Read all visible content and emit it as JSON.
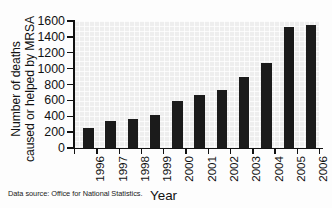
{
  "chart_data": {
    "type": "bar",
    "title": "",
    "xlabel": "Year",
    "ylabel": "Number of deaths caused or helped by MRSA",
    "ylabel_lines": [
      "Number of deaths",
      "caused or helped by MRSA"
    ],
    "categories": [
      "1996",
      "1997",
      "1998",
      "1999",
      "2000",
      "2001",
      "2002",
      "2003",
      "2004",
      "2005",
      "2006"
    ],
    "values": [
      254,
      343,
      365,
      415,
      597,
      673,
      736,
      900,
      1065,
      1530,
      1550
    ],
    "ylim": [
      0,
      1600
    ],
    "ytick_values": [
      0,
      200,
      400,
      600,
      800,
      1000,
      1200,
      1400,
      1600
    ],
    "ytick_labels": [
      "0",
      "200",
      "400",
      "600",
      "800",
      "1000",
      "1200",
      "1400",
      "1600"
    ],
    "grid": true,
    "legend": "none",
    "bar_color": "#1b1b1b",
    "plot_background": "#eeeeee",
    "axis_color": "#111111"
  },
  "annotations": {
    "source_note": "Data source: Office for National Statistics."
  }
}
